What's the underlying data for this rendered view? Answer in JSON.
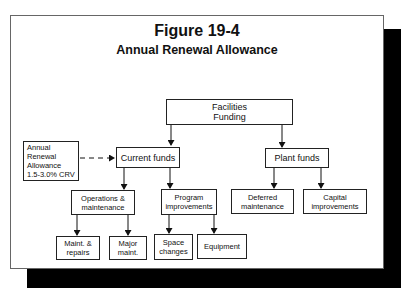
{
  "figure": {
    "title": "Figure 19-4",
    "subtitle": "Annual Renewal Allowance"
  },
  "nodes": {
    "facilities_funding": "Facilities\nFunding",
    "annual_renewal": "Annual\nRenewal\nAllowance\n1.5-3.0% CRV",
    "current_funds": "Current funds",
    "plant_funds": "Plant funds",
    "operations_maintenance": "Operations &\nmaintenance",
    "program_improvements": "Program\nimprovements",
    "deferred_maintenance": "Deferred\nmaintenance",
    "capital_improvements": "Capital\nimprovements",
    "maint_repairs": "Maint. &\nrepairs",
    "major_maint": "Major\nmaint.",
    "space_changes": "Space\nchanges",
    "equipment": "Equipment"
  },
  "edges": [
    {
      "from": "facilities_funding",
      "to": "current_funds",
      "style": "solid"
    },
    {
      "from": "facilities_funding",
      "to": "plant_funds",
      "style": "solid"
    },
    {
      "from": "annual_renewal",
      "to": "current_funds",
      "style": "dashed"
    },
    {
      "from": "current_funds",
      "to": "operations_maintenance",
      "style": "solid"
    },
    {
      "from": "current_funds",
      "to": "program_improvements",
      "style": "solid"
    },
    {
      "from": "plant_funds",
      "to": "deferred_maintenance",
      "style": "solid"
    },
    {
      "from": "plant_funds",
      "to": "capital_improvements",
      "style": "solid"
    },
    {
      "from": "operations_maintenance",
      "to": "maint_repairs",
      "style": "solid"
    },
    {
      "from": "operations_maintenance",
      "to": "major_maint",
      "style": "solid"
    },
    {
      "from": "program_improvements",
      "to": "space_changes",
      "style": "solid"
    },
    {
      "from": "program_improvements",
      "to": "equipment",
      "style": "solid"
    }
  ]
}
